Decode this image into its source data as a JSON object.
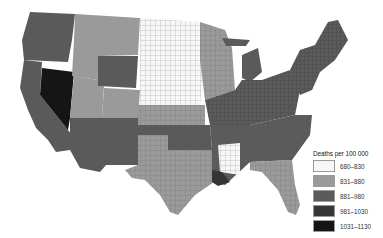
{
  "map": {
    "title": "",
    "region": "Contiguous United States",
    "unit": "county",
    "classes": [
      {
        "key": "c1",
        "label": "680–830",
        "color": "#f7f7f7"
      },
      {
        "key": "c2",
        "label": "831–880",
        "color": "#9a9a9a"
      },
      {
        "key": "c3",
        "label": "881–980",
        "color": "#5a5a5a"
      },
      {
        "key": "c4",
        "label": "981–1030",
        "color": "#353535"
      },
      {
        "key": "c5",
        "label": "1031–1130",
        "color": "#151515"
      }
    ],
    "regions": [
      {
        "name": "Pacific Northwest",
        "class": "c3"
      },
      {
        "name": "California",
        "class": "c3"
      },
      {
        "name": "Nevada",
        "class": "c5"
      },
      {
        "name": "Idaho/Montana",
        "class": "c2"
      },
      {
        "name": "Wyoming",
        "class": "c3"
      },
      {
        "name": "Utah",
        "class": "c2"
      },
      {
        "name": "Southwest",
        "class": "c3"
      },
      {
        "name": "Colorado",
        "class": "c2"
      },
      {
        "name": "Great Plains North",
        "class": "c1"
      },
      {
        "name": "Kansas",
        "class": "c2"
      },
      {
        "name": "Texas",
        "class": "c2"
      },
      {
        "name": "Oklahoma",
        "class": "c3"
      },
      {
        "name": "Upper Midwest",
        "class": "c2"
      },
      {
        "name": "Ohio Valley",
        "class": "c3"
      },
      {
        "name": "Northeast",
        "class": "c3"
      },
      {
        "name": "Southeast",
        "class": "c2"
      },
      {
        "name": "Mississippi",
        "class": "c1"
      },
      {
        "name": "Florida",
        "class": "c2"
      }
    ]
  },
  "legend": {
    "title": "Deaths per 100 000",
    "items": [
      {
        "label": "680–830",
        "color": "#f7f7f7"
      },
      {
        "label": "831–880",
        "color": "#9a9a9a"
      },
      {
        "label": "881–980",
        "color": "#5a5a5a"
      },
      {
        "label": "981–1030",
        "color": "#353535"
      },
      {
        "label": "1031–1130",
        "color": "#151515"
      }
    ]
  }
}
